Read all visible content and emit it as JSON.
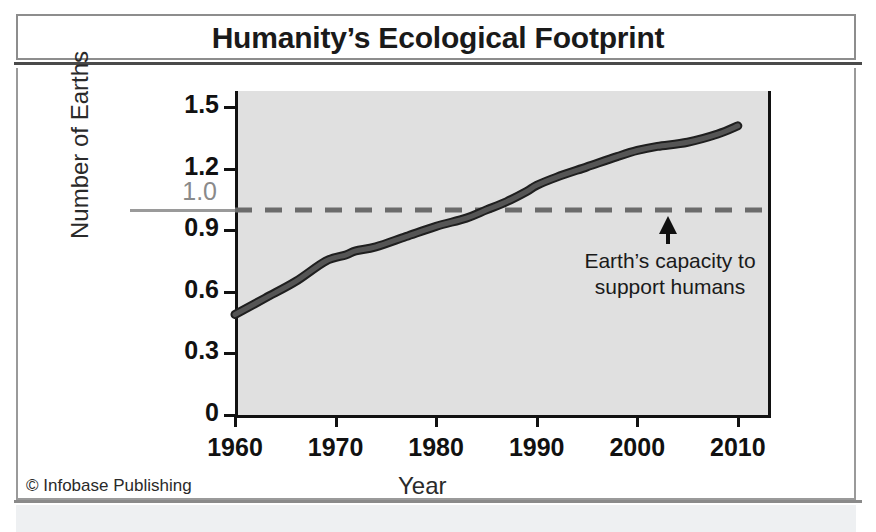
{
  "title": "Humanity’s Ecological Footprint",
  "copyright": "© Infobase Publishing",
  "annotation": {
    "line1": "Earth’s capacity to",
    "line2": "support humans",
    "icon": "up-arrow-icon"
  },
  "colors": {
    "plot_background": "#e0e0e0",
    "axis": "#111111",
    "line": "#555555",
    "line_edge": "#1f1f1f",
    "threshold": "#6b6b6b",
    "threshold_label": "#8a8a8a",
    "frame": "#9a9a9a",
    "page_background": "#ffffff"
  },
  "chart_data": {
    "type": "line",
    "title": "Humanity’s Ecological Footprint",
    "xlabel": "Year",
    "ylabel": "Number of Earths",
    "xlim": [
      1960,
      2013
    ],
    "ylim": [
      0,
      1.58
    ],
    "xticks": [
      1960,
      1970,
      1980,
      1990,
      2000,
      2010
    ],
    "xtick_labels": [
      "1960",
      "1970",
      "1980",
      "1990",
      "2000",
      "2010"
    ],
    "yticks": [
      0,
      0.3,
      0.6,
      0.9,
      1.2,
      1.5
    ],
    "ytick_labels": [
      "0",
      "0.3",
      "0.6",
      "0.9",
      "1.2",
      "1.5"
    ],
    "grid": false,
    "legend": "none",
    "threshold": {
      "value": 1.0,
      "label": "1.0",
      "style": "dashed",
      "description": "Earth’s capacity to support humans"
    },
    "series": [
      {
        "name": "Ecological footprint (number of Earths)",
        "x": [
          1960,
          1963,
          1966,
          1969,
          1971,
          1972,
          1974,
          1977,
          1980,
          1983,
          1985,
          1987,
          1989,
          1990,
          1992,
          1995,
          1998,
          2000,
          2002,
          2005,
          2008,
          2010
        ],
        "values": [
          0.49,
          0.57,
          0.65,
          0.75,
          0.78,
          0.8,
          0.82,
          0.87,
          0.92,
          0.96,
          1.0,
          1.04,
          1.09,
          1.12,
          1.16,
          1.21,
          1.26,
          1.29,
          1.31,
          1.33,
          1.37,
          1.41
        ]
      }
    ]
  }
}
